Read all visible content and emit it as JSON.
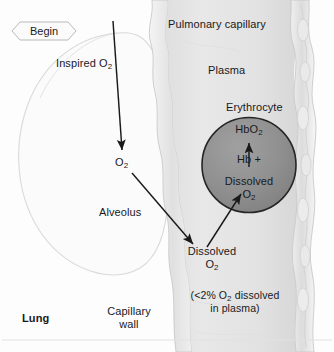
{
  "figure": {
    "title_hidden": "Oxygen diffusion from alveolus into pulmonary capillary",
    "background_color": "#fdfdfd"
  },
  "badge": {
    "name": "begin-badge",
    "label": "Begin"
  },
  "labels": {
    "inspired_o2": "Inspired O",
    "inspired_o2_sub": "2",
    "alveolar_o2": "O",
    "alveolar_o2_sub": "2",
    "alveolus": "Alveolus",
    "lung": "Lung",
    "capillary_wall_line1": "Capillary",
    "capillary_wall_line2": "wall",
    "pulmonary_capillary": "Pulmonary capillary",
    "plasma": "Plasma",
    "erythrocyte": "Erythrocyte",
    "hbo2": "HbO",
    "hbo2_sub": "2",
    "hb_plus": "Hb +",
    "dissolved_rbc_line1": "Dissolved",
    "dissolved_rbc_line2": "O",
    "dissolved_rbc_line2_sub": "2",
    "dissolved_plasma_line1": "Dissolved",
    "dissolved_plasma_line2": "O",
    "dissolved_plasma_line2_sub": "2",
    "note_line1_a": "(<2% O",
    "note_line1_sub": "2",
    "note_line1_b": " dissolved",
    "note_line2": "in plasma)"
  },
  "colors": {
    "erythrocyte_fill": "#8e8e8e",
    "erythrocyte_stroke": "#242424",
    "plasma_fill": "#e4e4e4",
    "capillary_wall_fill": "#ececec",
    "capillary_wall_stroke": "#c9c9c9",
    "alveolus_fill": "#fbfbfb",
    "alveolus_stroke": "#d8d8d8",
    "arrow_color": "#1a1a1a",
    "background": "#fdfdfd",
    "baseline_rule": "#dedede"
  },
  "arrows": [
    {
      "name": "inspired-o2-arrow",
      "from": [
        113,
        21
      ],
      "to": [
        122,
        150
      ],
      "label": "inspired O2 entering alveolus"
    },
    {
      "name": "alveolar-o2-to-plasma-arrow",
      "from": [
        132,
        173
      ],
      "to": [
        193,
        244
      ],
      "label": "O2 diffusing into plasma"
    },
    {
      "name": "plasma-to-erythrocyte-arrow",
      "from": [
        207,
        247
      ],
      "to": [
        241,
        194
      ],
      "label": "dissolved O2 entering erythrocyte"
    },
    {
      "name": "hb-binding-arrow",
      "from": [
        249,
        166
      ],
      "to": [
        249,
        142
      ],
      "label": "Hb plus dissolved O2 forms HbO2"
    }
  ]
}
